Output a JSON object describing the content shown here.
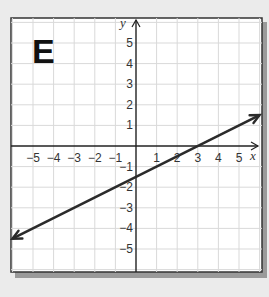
{
  "panel_label": "E",
  "chart_data": {
    "type": "line",
    "title": "E",
    "xlabel": "x",
    "ylabel": "y",
    "xlim": [
      -5.9,
      6.1
    ],
    "ylim": [
      -6.2,
      6.1
    ],
    "grid": true,
    "x_ticks": [
      -5,
      -4,
      -3,
      -2,
      -1,
      1,
      2,
      3,
      4,
      5
    ],
    "y_ticks": [
      5,
      4,
      3,
      2,
      1,
      -1,
      -2,
      -3,
      -4,
      -5
    ],
    "x_tick_labels": [
      "−5",
      "−4",
      "−3",
      "−2",
      "−1",
      "1",
      "2",
      "3",
      "4",
      "5"
    ],
    "y_tick_labels": [
      "5",
      "4",
      "3",
      "2",
      "1",
      "−1",
      "−2",
      "−3",
      "−4",
      "−5"
    ],
    "series": [
      {
        "name": "line",
        "equation": "y = 0.5x - 1.5",
        "slope": 0.5,
        "y_intercept": -1.5,
        "x_intercept": 3,
        "x": [
          -6,
          6
        ],
        "y": [
          -4.5,
          1.5
        ],
        "arrows_both_ends": true,
        "color": "#2b2b2b"
      }
    ]
  },
  "colors": {
    "background": "#ebebeb",
    "panel": "#ffffff",
    "grid": "#d9d9d9",
    "axis": "#222222",
    "border": "#333333",
    "shadow": "#9a9a9a"
  }
}
